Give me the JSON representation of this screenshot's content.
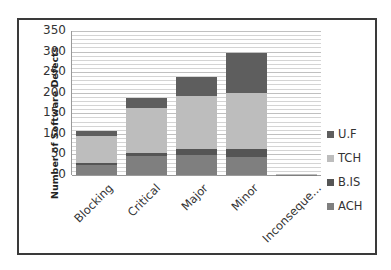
{
  "chart_data": {
    "type": "bar",
    "stacked": true,
    "title": "",
    "xlabel": "",
    "ylabel": "Number of Software Defects",
    "ylim": [
      0,
      350
    ],
    "yticks": [
      0,
      50,
      100,
      150,
      200,
      250,
      300,
      350
    ],
    "grid": true,
    "legend_position": "right",
    "categories": [
      "Blocking",
      "Critical",
      "Major",
      "Minor",
      "Inconseque..."
    ],
    "series": [
      {
        "name": "ACH",
        "color": "#7f7f7f",
        "values": [
          25,
          47,
          48,
          45,
          1
        ]
      },
      {
        "name": "B.IS",
        "color": "#555555",
        "values": [
          5,
          6,
          15,
          18,
          0
        ]
      },
      {
        "name": "TCH",
        "color": "#bdbdbd",
        "values": [
          65,
          110,
          130,
          137,
          1
        ]
      },
      {
        "name": "U.F",
        "color": "#5e5e5e",
        "values": [
          12,
          24,
          45,
          97,
          0
        ]
      }
    ],
    "totals": [
      107,
      187,
      238,
      297,
      2
    ],
    "legend_order": [
      "U.F",
      "TCH",
      "B.IS",
      "ACH"
    ]
  },
  "axis": {
    "ylabel": "Number of Software Defects",
    "yticks": [
      "350",
      "300",
      "250",
      "200",
      "150",
      "100",
      "50",
      "0"
    ]
  },
  "legend": [
    {
      "label": "U.F",
      "color": "#5e5e5e"
    },
    {
      "label": "TCH",
      "color": "#bdbdbd"
    },
    {
      "label": "B.IS",
      "color": "#555555"
    },
    {
      "label": "ACH",
      "color": "#7f7f7f"
    }
  ]
}
